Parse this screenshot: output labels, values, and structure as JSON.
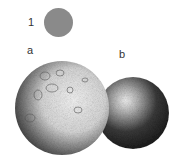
{
  "figure": {
    "labels": {
      "one": "1",
      "a": "a",
      "b": "b"
    },
    "items": [
      {
        "id": "1",
        "description": "small flat gray disc",
        "color": "#8a8a8a"
      },
      {
        "id": "a",
        "description": "large stippled sphere with crater-like surface, lit from upper right"
      },
      {
        "id": "b",
        "description": "smaller dark stippled sphere with bright highlight at upper left"
      }
    ]
  }
}
